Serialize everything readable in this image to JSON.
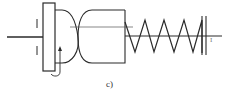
{
  "figure": {
    "caption": "c)",
    "end_marker": "I"
  },
  "colors": {
    "line": "#2a2a2a",
    "thin_line": "#555555",
    "background": "#ffffff"
  },
  "components": [
    "input-shaft",
    "clutch-plate",
    "friction-cam-left",
    "friction-cam-right",
    "compression-spring",
    "fixed-stop",
    "rotation-arrow"
  ]
}
